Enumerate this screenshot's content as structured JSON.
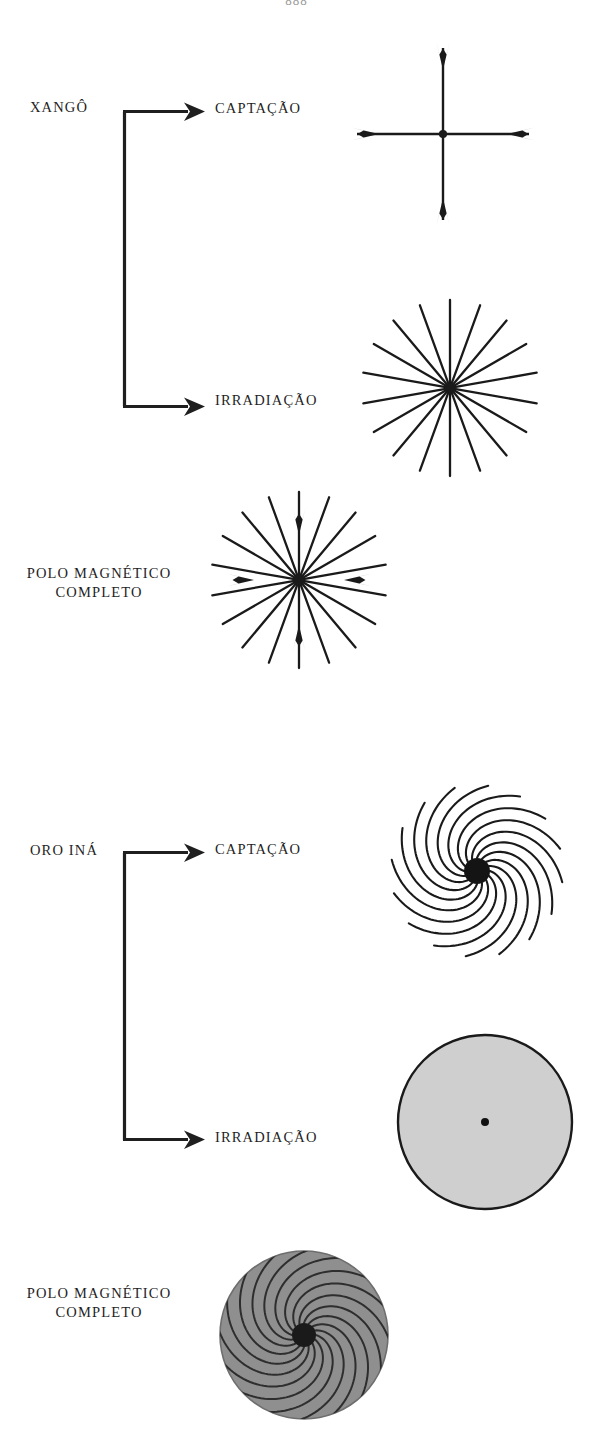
{
  "page": {
    "folio": "888",
    "width": 593,
    "height": 1440,
    "background_color": "#ffffff",
    "ink_color": "#1f1f1f"
  },
  "sections": [
    {
      "id": "xango",
      "entity_label": "XANGÔ",
      "branches": [
        {
          "id": "captacao",
          "label": "CAPTAÇÃO",
          "figure": "cross-inward-arrows"
        },
        {
          "id": "irradiacao",
          "label": "IRRADIAÇÃO",
          "figure": "radial-starburst"
        }
      ],
      "summary_label_line1": "POLO MAGNÉTICO",
      "summary_label_line2": "COMPLETO",
      "summary_figure": "starburst-with-inward-arrows"
    },
    {
      "id": "oro-ina",
      "entity_label": "ORO INÁ",
      "branches": [
        {
          "id": "captacao",
          "label": "CAPTAÇÃO",
          "figure": "spiral-pinwheel"
        },
        {
          "id": "irradiacao",
          "label": "IRRADIAÇÃO",
          "figure": "gray-filled-disc"
        }
      ],
      "summary_label_line1": "POLO MAGNÉTICO",
      "summary_label_line2": "COMPLETO",
      "summary_figure": "gray-disc-with-spiral-arms"
    }
  ],
  "figures": {
    "cross_inward_arrows": {
      "name": "cross-inward-arrows",
      "center": [
        443,
        134
      ],
      "arm_length": 96,
      "arm_count": 4,
      "arrow_direction": "inward",
      "hub_radius": 4
    },
    "radial_starburst": {
      "name": "radial-starburst",
      "center": [
        450,
        388
      ],
      "ray_count": 18,
      "ray_length": 88,
      "hub_radius": 5
    },
    "starburst_with_inward_arrows": {
      "name": "starburst-with-inward-arrows",
      "center": [
        299,
        580
      ],
      "ray_count": 18,
      "ray_length": 88,
      "arrow_arms": 4,
      "arrow_direction": "inward",
      "hub_radius": 5
    },
    "spiral_pinwheel": {
      "name": "spiral-pinwheel",
      "center": [
        477,
        871
      ],
      "arm_count": 16,
      "arm_length": 86,
      "spiral_twist_degrees": 120,
      "hub_radius": 13,
      "hub_fill": "#141414"
    },
    "gray_filled_disc": {
      "name": "gray-filled-disc",
      "center": [
        485,
        1122
      ],
      "radius": 88,
      "fill": "#cfcfcf",
      "stroke": "#1a1a1a",
      "center_dot_radius": 4
    },
    "gray_disc_with_spiral_arms": {
      "name": "gray-disc-with-spiral-arms",
      "center": [
        303,
        1335
      ],
      "radius": 84,
      "fill": "#8f8f8f",
      "arm_count": 16,
      "spiral_twist_degrees": 120,
      "hub_radius": 12,
      "hub_fill": "#1a1a1a"
    }
  },
  "connectors": [
    {
      "id": "xango-bracket",
      "x": 123,
      "top_y": 110,
      "bottom_y": 401,
      "arrow_tip_x": 203,
      "stroke_width": 3
    },
    {
      "id": "oro-ina-bracket",
      "x": 123,
      "top_y": 852,
      "bottom_y": 1139,
      "arrow_tip_x": 203,
      "stroke_width": 3
    }
  ]
}
